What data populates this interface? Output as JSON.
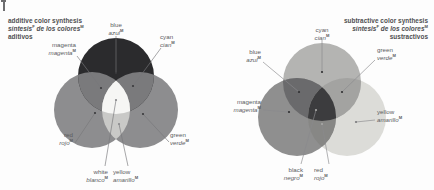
{
  "figure": {
    "type": "color-synthesis-venn-diagrams",
    "panels": [
      {
        "id": "additive",
        "title": {
          "line1": "additive color synthesis",
          "line2_a": "síntesis",
          "line2_sup": "F",
          "line2_b": " de los colores",
          "line2_sup2": "M",
          "line3": "aditivos"
        },
        "circles": [
          {
            "name": "blue",
            "color": "#2b2b2d"
          },
          {
            "name": "red",
            "color": "#8d8d8f"
          },
          {
            "name": "green",
            "color": "#8d8d8f"
          }
        ],
        "overlaps": [
          {
            "name": "magenta",
            "color": "#787878"
          },
          {
            "name": "cyan",
            "color": "#787878"
          },
          {
            "name": "yellow",
            "color": "#c9c9c7"
          },
          {
            "name": "white",
            "color": "#f4f4f2"
          }
        ],
        "labels": [
          {
            "en": "blue",
            "es": "azul",
            "sup": "M"
          },
          {
            "en": "cyan",
            "es": "cian",
            "sup": "M"
          },
          {
            "en": "magenta",
            "es": "magenta",
            "sup": "M"
          },
          {
            "en": "red",
            "es": "rojo",
            "sup": "M"
          },
          {
            "en": "green",
            "es": "verde",
            "sup": "M"
          },
          {
            "en": "white",
            "es": "blanco",
            "sup": "M"
          },
          {
            "en": "yellow",
            "es": "amarillo",
            "sup": "M"
          }
        ]
      },
      {
        "id": "subtractive",
        "title": {
          "line1": "subtractive color synthesis",
          "line2_a": "síntesis",
          "line2_sup": "F",
          "line2_b": " de los colores",
          "line2_sup2": "M",
          "line3": "sustractivos"
        },
        "circles": [
          {
            "name": "cyan",
            "color": "#b4b4b2"
          },
          {
            "name": "magenta",
            "color": "#8f8f8f"
          },
          {
            "name": "yellow",
            "color": "#dadad6"
          }
        ],
        "overlaps": [
          {
            "name": "blue",
            "color": "#6a6a6c"
          },
          {
            "name": "green",
            "color": "#a0a09e"
          },
          {
            "name": "red",
            "color": "#858583"
          },
          {
            "name": "black",
            "color": "#3c3c3e"
          }
        ],
        "labels": [
          {
            "en": "cyan",
            "es": "cian",
            "sup": "M"
          },
          {
            "en": "blue",
            "es": "azul",
            "sup": "M"
          },
          {
            "en": "magenta",
            "es": "magenta",
            "sup": "M"
          },
          {
            "en": "green",
            "es": "verde",
            "sup": "M"
          },
          {
            "en": "yellow",
            "es": "amarillo",
            "sup": "M"
          },
          {
            "en": "black",
            "es": "negro",
            "sup": "M"
          },
          {
            "en": "red",
            "es": "rojo",
            "sup": "M"
          }
        ]
      }
    ]
  }
}
